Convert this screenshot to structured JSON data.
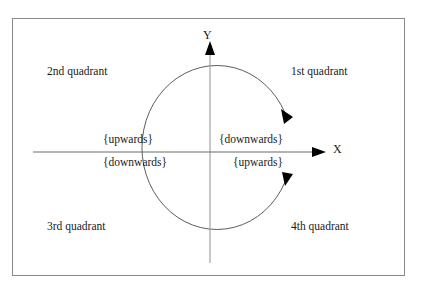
{
  "figure": {
    "background_color": "#ffffff",
    "border_color": "#8a8a8a",
    "ink_color": "#1a1a1a"
  },
  "axes": {
    "x_label": "X",
    "y_label": "Y",
    "x_arrow_direction": "right",
    "y_arrow_direction": "up"
  },
  "quadrants": [
    {
      "id": "first",
      "label": "1st quadrant"
    },
    {
      "id": "second",
      "label": "2nd quadrant"
    },
    {
      "id": "third",
      "label": "3rd quadrant"
    },
    {
      "id": "fourth",
      "label": "4th quadrant"
    }
  ],
  "directions": {
    "upper_left": "{upwards}",
    "lower_left": "{downwards}",
    "upper_right": "{downwards}",
    "lower_right": "{upwards}"
  },
  "circle": {
    "arrow_upper_right_direction": "clockwise-down",
    "arrow_lower_right_direction": "counterclockwise-up"
  }
}
